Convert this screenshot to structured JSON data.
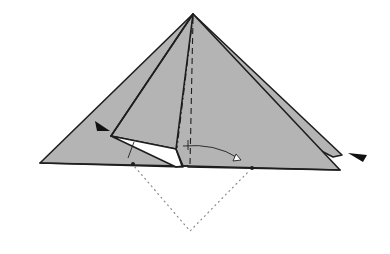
{
  "diagram": {
    "type": "origami-fold-step",
    "colors": {
      "paper": "#b4b4b4",
      "line": "#1e1e1e",
      "background": "#ffffff",
      "guide": "#8a8a8a"
    },
    "symbols": [
      {
        "name": "push-arrow-left",
        "meaning": "push / sink here"
      },
      {
        "name": "push-arrow-right",
        "meaning": "push / sink here"
      },
      {
        "name": "swing-arrow",
        "meaning": "fold flap over to the right"
      },
      {
        "name": "valley-fold-line",
        "meaning": "valley fold (dashed)"
      },
      {
        "name": "mountain-fold-line",
        "meaning": "mountain fold (dash-dot)"
      },
      {
        "name": "reference-dots",
        "meaning": "reference points"
      },
      {
        "name": "hidden-corner-outline",
        "meaning": "dotted outline of corner behind"
      }
    ]
  }
}
